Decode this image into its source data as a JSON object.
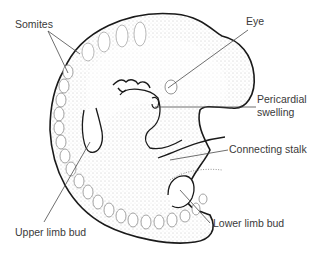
{
  "figure": {
    "labels": {
      "somites": "Somites",
      "eye": "Eye",
      "pericardial_line1": "Pericardial",
      "pericardial_line2": "swelling",
      "connecting_stalk": "Connecting stalk",
      "upper_limb_bud": "Upper limb bud",
      "lower_limb_bud": "Lower limb bud"
    },
    "colors": {
      "outline": "#1a1a1a",
      "leader_line": "#4a4a4a",
      "label_text": "#3a3a3a",
      "stipple": "#7a7a7a"
    }
  }
}
